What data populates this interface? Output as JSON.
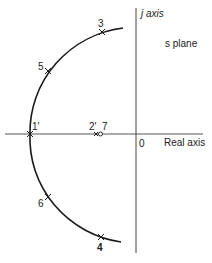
{
  "diagram": {
    "plane_label": "s plane",
    "imag_axis_label": "j axis",
    "real_axis_label": "Real axis",
    "origin_label": "0",
    "points": [
      {
        "label": "3",
        "x": 102,
        "y": 32
      },
      {
        "label": "5",
        "x": 48,
        "y": 71
      },
      {
        "label": "1'",
        "x": 30,
        "y": 134
      },
      {
        "label": "6",
        "x": 48,
        "y": 197
      },
      {
        "label": "4",
        "x": 101,
        "y": 237
      }
    ],
    "pole_zero_labels": {
      "pole": "2'",
      "zero": "7"
    },
    "colors": {
      "stroke": "#1a1a1a",
      "background": "#ffffff"
    }
  }
}
